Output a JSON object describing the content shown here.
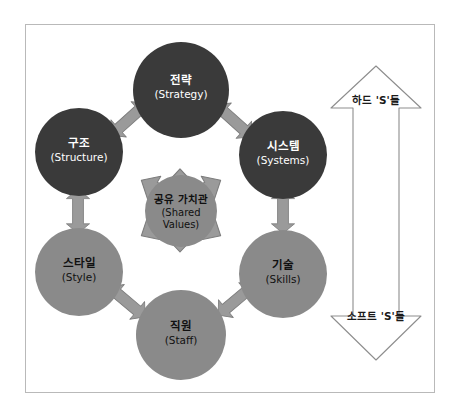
{
  "diagram": {
    "frame": {
      "border_color": "#b9b9b9",
      "background": "#ffffff"
    },
    "colors": {
      "hard_circle": "#3a3a3a",
      "soft_circle": "#8a8a8a",
      "hub_circle": "#8a8a8a",
      "arrow_fill": "#9a9a9a",
      "arrow_stroke": "#7c7c7c",
      "outline_arrow_stroke": "#8d8d8d",
      "dark_text": "#111111",
      "light_text": "#ffffff"
    },
    "nodes": [
      {
        "id": "strategy",
        "ko": "전략",
        "en": "(Strategy)",
        "group": "hard"
      },
      {
        "id": "structure",
        "ko": "구조",
        "en": "(Structure)",
        "group": "hard"
      },
      {
        "id": "systems",
        "ko": "시스템",
        "en": "(Systems)",
        "group": "hard"
      },
      {
        "id": "style",
        "ko": "스타일",
        "en": "(Style)",
        "group": "soft"
      },
      {
        "id": "skills",
        "ko": "기술",
        "en": "(Skills)",
        "group": "soft"
      },
      {
        "id": "staff",
        "ko": "직원",
        "en": "(Staff)",
        "group": "soft"
      }
    ],
    "hub": {
      "id": "shared-values",
      "ko": "공유 가치관",
      "en_line1": "(Shared",
      "en_line2": "Values)"
    },
    "scale": {
      "top_label": "하드 'S'들",
      "bottom_label": "소프트 'S'들"
    }
  }
}
